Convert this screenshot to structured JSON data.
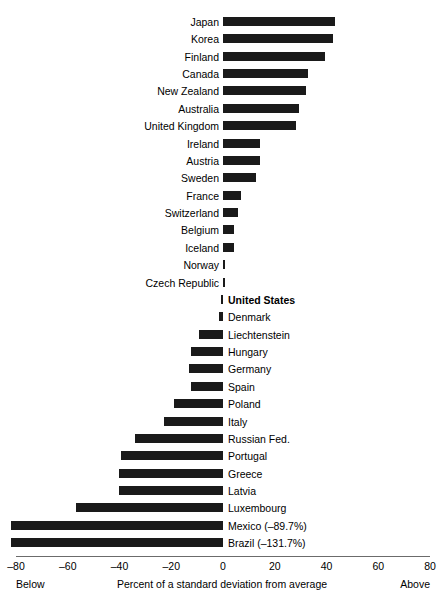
{
  "chart_data": {
    "type": "bar",
    "orientation": "horizontal",
    "title": "",
    "subtitle": "",
    "xlabel": "Percent of a standard deviation from average",
    "ylabel": "",
    "xlim": [
      -80,
      80
    ],
    "xticks": [
      -80,
      -60,
      -40,
      -20,
      0,
      20,
      40,
      60,
      80
    ],
    "xtick_labels": [
      "–80",
      "–60",
      "–40",
      "–20",
      "0",
      "20",
      "40",
      "60",
      "80"
    ],
    "grid": false,
    "legend": null,
    "axis_end_labels": {
      "left": "Below",
      "right": "Above"
    },
    "bar_color": "#1a1a1a",
    "categories": [
      "Japan",
      "Korea",
      "Finland",
      "Canada",
      "New Zealand",
      "Australia",
      "United Kingdom",
      "Ireland",
      "Austria",
      "Sweden",
      "France",
      "Switzerland",
      "Belgium",
      "Iceland",
      "Norway",
      "Czech Republic",
      "United States",
      "Denmark",
      "Liechtenstein",
      "Hungary",
      "Germany",
      "Spain",
      "Poland",
      "Italy",
      "Russian Fed.",
      "Portugal",
      "Greece",
      "Latvia",
      "Luxembourg",
      "Mexico",
      "Brazil"
    ],
    "values": [
      43.2,
      42.4,
      39.6,
      33.0,
      32.0,
      29.4,
      28.3,
      14.3,
      14.3,
      12.8,
      7.0,
      5.8,
      4.3,
      4.3,
      0.8,
      0.6,
      -0.8,
      -1.4,
      -9.3,
      -12.4,
      -13.1,
      -12.4,
      -19.0,
      -22.8,
      -34.0,
      -39.4,
      -40.2,
      -40.2,
      -56.8,
      -89.7,
      -131.7
    ],
    "bars": [
      {
        "label": "Japan",
        "value": 43.2,
        "label_side": "left",
        "bold": false,
        "annotation": ""
      },
      {
        "label": "Korea",
        "value": 42.4,
        "label_side": "left",
        "bold": false,
        "annotation": ""
      },
      {
        "label": "Finland",
        "value": 39.6,
        "label_side": "left",
        "bold": false,
        "annotation": ""
      },
      {
        "label": "Canada",
        "value": 33.0,
        "label_side": "left",
        "bold": false,
        "annotation": ""
      },
      {
        "label": "New Zealand",
        "value": 32.0,
        "label_side": "left",
        "bold": false,
        "annotation": ""
      },
      {
        "label": "Australia",
        "value": 29.4,
        "label_side": "left",
        "bold": false,
        "annotation": ""
      },
      {
        "label": "United Kingdom",
        "value": 28.3,
        "label_side": "left",
        "bold": false,
        "annotation": ""
      },
      {
        "label": "Ireland",
        "value": 14.3,
        "label_side": "left",
        "bold": false,
        "annotation": ""
      },
      {
        "label": "Austria",
        "value": 14.3,
        "label_side": "left",
        "bold": false,
        "annotation": ""
      },
      {
        "label": "Sweden",
        "value": 12.8,
        "label_side": "left",
        "bold": false,
        "annotation": ""
      },
      {
        "label": "France",
        "value": 7.0,
        "label_side": "left",
        "bold": false,
        "annotation": ""
      },
      {
        "label": "Switzerland",
        "value": 5.8,
        "label_side": "left",
        "bold": false,
        "annotation": ""
      },
      {
        "label": "Belgium",
        "value": 4.3,
        "label_side": "left",
        "bold": false,
        "annotation": ""
      },
      {
        "label": "Iceland",
        "value": 4.3,
        "label_side": "left",
        "bold": false,
        "annotation": ""
      },
      {
        "label": "Norway",
        "value": 0.8,
        "label_side": "left",
        "bold": false,
        "annotation": ""
      },
      {
        "label": "Czech Republic",
        "value": 0.6,
        "label_side": "left",
        "bold": false,
        "annotation": ""
      },
      {
        "label": "United States",
        "value": -0.8,
        "label_side": "right",
        "bold": true,
        "annotation": ""
      },
      {
        "label": "Denmark",
        "value": -1.4,
        "label_side": "right",
        "bold": false,
        "annotation": ""
      },
      {
        "label": "Liechtenstein",
        "value": -9.3,
        "label_side": "right",
        "bold": false,
        "annotation": ""
      },
      {
        "label": "Hungary",
        "value": -12.4,
        "label_side": "right",
        "bold": false,
        "annotation": ""
      },
      {
        "label": "Germany",
        "value": -13.1,
        "label_side": "right",
        "bold": false,
        "annotation": ""
      },
      {
        "label": "Spain",
        "value": -12.4,
        "label_side": "right",
        "bold": false,
        "annotation": ""
      },
      {
        "label": "Poland",
        "value": -19.0,
        "label_side": "right",
        "bold": false,
        "annotation": ""
      },
      {
        "label": "Italy",
        "value": -22.8,
        "label_side": "right",
        "bold": false,
        "annotation": ""
      },
      {
        "label": "Russian Fed.",
        "value": -34.0,
        "label_side": "right",
        "bold": false,
        "annotation": ""
      },
      {
        "label": "Portugal",
        "value": -39.4,
        "label_side": "right",
        "bold": false,
        "annotation": ""
      },
      {
        "label": "Greece",
        "value": -40.2,
        "label_side": "right",
        "bold": false,
        "annotation": ""
      },
      {
        "label": "Latvia",
        "value": -40.2,
        "label_side": "right",
        "bold": false,
        "annotation": ""
      },
      {
        "label": "Luxembourg",
        "value": -56.8,
        "label_side": "right",
        "bold": false,
        "annotation": ""
      },
      {
        "label": "Mexico",
        "value": -89.7,
        "label_side": "right",
        "bold": false,
        "annotation": "(–89.7%)"
      },
      {
        "label": "Brazil",
        "value": -131.7,
        "label_side": "right",
        "bold": false,
        "annotation": "(–131.7%)"
      }
    ]
  }
}
